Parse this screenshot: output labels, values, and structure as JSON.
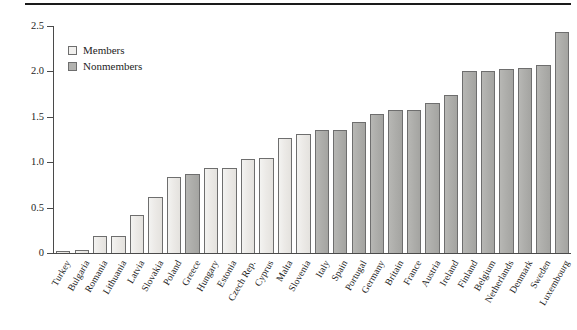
{
  "chart_data": {
    "type": "bar",
    "title": "",
    "xlabel": "",
    "ylabel": "",
    "ylim": [
      0,
      2.5
    ],
    "ytick_values": [
      0,
      0.5,
      1.0,
      1.5,
      2.0,
      2.5
    ],
    "ytick_labels": [
      "0",
      "0.5",
      "1.0",
      "1.5",
      "2.0",
      "2.5"
    ],
    "grid": false,
    "legend_position": "upper left",
    "legend": [
      {
        "key": "member",
        "label": "Members",
        "color": "#f1f0ee"
      },
      {
        "key": "nonmember",
        "label": "Nonmembers",
        "color": "#b2b2af"
      }
    ],
    "categories": [
      "Turkey",
      "Bulgaria",
      "Romania",
      "Lithuania",
      "Latvia",
      "Slovakia",
      "Poland",
      "Greece",
      "Hungary",
      "Estonia",
      "Czech Rep.",
      "Cyprus",
      "Malta",
      "Slovenia",
      "Italy",
      "Spain",
      "Portugal",
      "Germany",
      "Britain",
      "France",
      "Austria",
      "Ireland",
      "Finland",
      "Belgium",
      "Netherlands",
      "Denmark",
      "Sweden",
      "Luxembourg"
    ],
    "values": [
      0.02,
      0.03,
      0.19,
      0.19,
      0.42,
      0.62,
      0.84,
      0.87,
      0.94,
      0.94,
      1.04,
      1.05,
      1.27,
      1.31,
      1.35,
      1.36,
      1.44,
      1.53,
      1.58,
      1.58,
      1.65,
      1.74,
      2.0,
      2.01,
      2.03,
      2.04,
      2.07,
      2.43
    ],
    "groups": [
      "member",
      "member",
      "member",
      "member",
      "member",
      "member",
      "member",
      "nonmember",
      "member",
      "member",
      "member",
      "member",
      "member",
      "member",
      "nonmember",
      "nonmember",
      "nonmember",
      "nonmember",
      "nonmember",
      "nonmember",
      "nonmember",
      "nonmember",
      "nonmember",
      "nonmember",
      "nonmember",
      "nonmember",
      "nonmember",
      "nonmember"
    ]
  }
}
